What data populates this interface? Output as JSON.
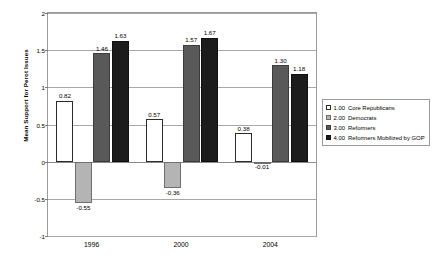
{
  "chart_data": {
    "type": "bar",
    "title": "",
    "xlabel": "",
    "ylabel": "Mean Support for Perot Issues",
    "categories": [
      "1996",
      "2000",
      "2004"
    ],
    "ylim": [
      -1,
      2
    ],
    "yticks": [
      "2",
      "1.5",
      "1",
      "0.5",
      "0",
      "-0.5",
      "-1"
    ],
    "ytick_values": [
      2,
      1.5,
      1,
      0.5,
      0,
      -0.5,
      -1
    ],
    "grid": true,
    "legend_position": "right",
    "series": [
      {
        "name": "Core Republicans",
        "key": "1.00",
        "color": "#ffffff",
        "values": [
          0.82,
          0.57,
          0.38
        ],
        "labels": [
          "0.82",
          "0.57",
          "0.38"
        ]
      },
      {
        "name": "Democrats",
        "key": "2.00",
        "color": "#b4b4b4",
        "values": [
          -0.55,
          -0.36,
          -0.01
        ],
        "labels": [
          "-0.55",
          "-0.36",
          "-0.01"
        ]
      },
      {
        "name": "Reformers",
        "key": "3.00",
        "color": "#595959",
        "values": [
          1.46,
          1.57,
          1.3
        ],
        "labels": [
          "1.46",
          "1.57",
          "1.30"
        ]
      },
      {
        "name": "Reformers Mobilized by GOP",
        "key": "4.00",
        "color": "#1c1c1c",
        "values": [
          1.63,
          1.67,
          1.18
        ],
        "labels": [
          "1.63",
          "1.67",
          "1.18"
        ]
      }
    ]
  },
  "legend": {
    "entries": [
      {
        "key": "1.00",
        "label": "Core Republicans"
      },
      {
        "key": "2.00",
        "label": "Democrats"
      },
      {
        "key": "3.00",
        "label": "Reformers"
      },
      {
        "key": "4.00",
        "label": "Reformers Mobilized by GOP"
      }
    ]
  }
}
